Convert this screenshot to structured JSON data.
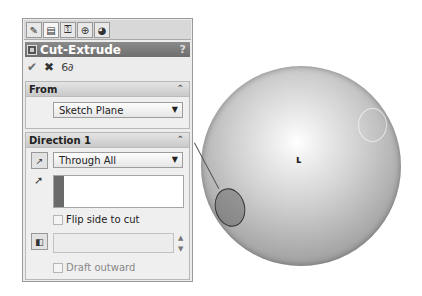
{
  "property_manager": {
    "tabs": [
      {
        "icon": "feature-manager-icon",
        "glyph": "✎"
      },
      {
        "icon": "property-manager-icon",
        "glyph": "▤",
        "active": true
      },
      {
        "icon": "configuration-manager-icon",
        "glyph": "⚿"
      },
      {
        "icon": "dimxpert-manager-icon",
        "glyph": "⊕"
      },
      {
        "icon": "display-manager-icon",
        "glyph": "◕"
      }
    ],
    "title": "Cut-Extrude",
    "help": "?",
    "actions": {
      "ok": "✔",
      "cancel": "✖",
      "detailed_preview": "6∂"
    },
    "from": {
      "header": "From",
      "collapse": "⌃",
      "selected": "Sketch Plane"
    },
    "direction1": {
      "header": "Direction 1",
      "collapse": "⌃",
      "end_condition": "Through All",
      "flip_side_label": "Flip side to cut",
      "draft_outward_label": "Draft outward",
      "draft_angle_value": ""
    }
  },
  "viewport": {
    "model": "sphere",
    "origin_marker": "ʟ"
  }
}
